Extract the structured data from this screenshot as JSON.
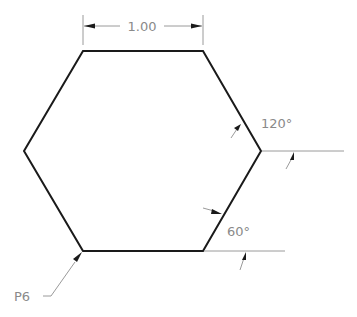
{
  "figure": {
    "shape": "regular hexagon",
    "dimension_label": "1.00",
    "angle_labels": {
      "upper_right": "120°",
      "lower_right": "60°"
    },
    "point_label": "P6",
    "colors": {
      "outline": "#1a1a1a",
      "annotation": "#8a8a8a"
    }
  }
}
